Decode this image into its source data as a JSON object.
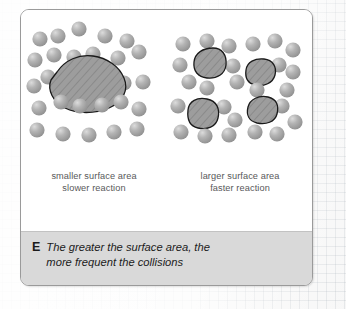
{
  "figure": {
    "key_letter": "E",
    "caption_lines": [
      "The greater the surface area, the",
      "more frequent the collisions"
    ],
    "panels": [
      {
        "id": "smaller-surface-area",
        "caption_lines": [
          "smaller surface area",
          "slower reaction"
        ]
      },
      {
        "id": "larger-surface-area",
        "caption_lines": [
          "larger surface area",
          "faster reaction"
        ]
      }
    ]
  },
  "colors": {
    "particle_fill": "#a8a8a8",
    "particle_highlight": "#d2d2d2",
    "solid_fill": "#9d9d9d",
    "solid_outline": "#1a1a1a",
    "caption_bar": "#d9d9d9",
    "card_border": "#9a9a9a",
    "label_text": "#58585a",
    "caption_text": "#1b1b1b"
  },
  "diagram_data": {
    "type": "diagram",
    "subject": "Effect of surface area on reaction rate",
    "left_panel": {
      "solid_pieces": 1,
      "particles": 22,
      "particle_radius": 7.6,
      "solid_shapes": [
        {
          "cx": 72,
          "cy": 80,
          "points": "38,-4 56,-16 74,-11 86,2 90,16 78,26 56,30 36,24 26,12 28,0"
        }
      ],
      "particle_positions": [
        [
          19,
          29
        ],
        [
          37,
          26
        ],
        [
          58,
          19
        ],
        [
          84,
          26
        ],
        [
          106,
          31
        ],
        [
          14,
          50
        ],
        [
          33,
          45
        ],
        [
          53,
          47
        ],
        [
          72,
          44
        ],
        [
          97,
          48
        ],
        [
          118,
          42
        ],
        [
          13,
          76
        ],
        [
          27,
          67
        ],
        [
          103,
          73
        ],
        [
          122,
          72
        ],
        [
          18,
          98
        ],
        [
          40,
          92
        ],
        [
          59,
          96
        ],
        [
          81,
          95
        ],
        [
          100,
          92
        ],
        [
          118,
          99
        ],
        [
          16,
          120
        ],
        [
          42,
          124
        ],
        [
          68,
          125
        ],
        [
          93,
          122
        ],
        [
          116,
          119
        ]
      ]
    },
    "right_panel": {
      "solid_pieces": 4,
      "particles": 24,
      "particle_radius": 7.6,
      "solid_shapes": [
        {
          "cx": 42,
          "cy": 54,
          "rx": 17,
          "ry": 13
        },
        {
          "cx": 93,
          "cy": 63,
          "rx": 15,
          "ry": 12
        },
        {
          "cx": 36,
          "cy": 105,
          "rx": 16,
          "ry": 13
        },
        {
          "cx": 95,
          "cy": 101,
          "rx": 15,
          "ry": 12
        }
      ],
      "particle_positions": [
        [
          16,
          34
        ],
        [
          40,
          31
        ],
        [
          62,
          36
        ],
        [
          86,
          34
        ],
        [
          108,
          31
        ],
        [
          126,
          40
        ],
        [
          13,
          55
        ],
        [
          22,
          72
        ],
        [
          66,
          56
        ],
        [
          70,
          72
        ],
        [
          112,
          55
        ],
        [
          126,
          62
        ],
        [
          40,
          78
        ],
        [
          90,
          80
        ],
        [
          120,
          80
        ],
        [
          11,
          96
        ],
        [
          57,
          97
        ],
        [
          68,
          110
        ],
        [
          115,
          96
        ],
        [
          14,
          122
        ],
        [
          38,
          126
        ],
        [
          62,
          125
        ],
        [
          88,
          122
        ],
        [
          110,
          124
        ],
        [
          128,
          112
        ]
      ]
    }
  }
}
